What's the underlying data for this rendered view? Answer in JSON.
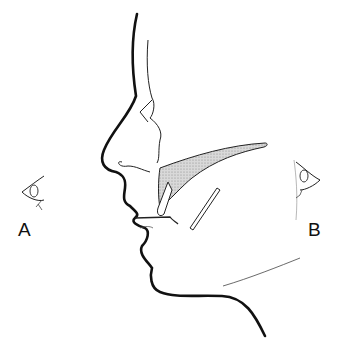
{
  "figure": {
    "labels": {
      "a": "A",
      "b": "B"
    },
    "colors": {
      "line": "#111111",
      "shading": "#c8c8c8",
      "background": "#ffffff"
    }
  }
}
